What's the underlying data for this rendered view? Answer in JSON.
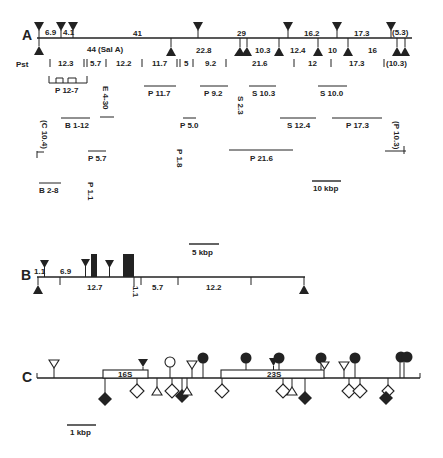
{
  "figure": {
    "panels": [
      "A",
      "B",
      "C"
    ]
  },
  "panel_a": {
    "label": "A",
    "row_label": "Pst",
    "top_fragments": [
      "6.9",
      "4.1",
      "41",
      "29",
      "16.2",
      "17.3",
      "(5.3)"
    ],
    "below_fragments": [
      "44 (Sal A)",
      "22.8",
      "10.3",
      "12.4",
      "10",
      "16"
    ],
    "pst_fragments": [
      "12.3",
      "5.7",
      "12.2",
      "11.7",
      "5",
      "9.2",
      "21.6",
      "12",
      "17.3",
      "(10.3)"
    ],
    "clones": {
      "p12_7": "P 12-7",
      "p11_7": "P 11.7",
      "p9_2": "P 9.2",
      "s10_3": "S 10.3",
      "s10_0": "S 10.0",
      "e4_30": "E 4-30",
      "s2_3": "S 2.3",
      "b1_12": "B 1-12",
      "p5_0": "P 5.0",
      "s12_4": "S 12.4",
      "p17_3": "P 17.3",
      "c10_4": "(C 10.4)",
      "p10_3": "(P 10.3)",
      "p5_7": "P 5.7",
      "p1_8": "P 1.8",
      "p21_6": "P 21.6",
      "b2_8": "B 2-8",
      "p1_1": "P 1.1"
    },
    "scale": "10 kbp"
  },
  "panel_b": {
    "label": "B",
    "fragments_top": [
      "1.1",
      "6.9"
    ],
    "fragments_bottom": [
      "12.7",
      "1.1",
      "5.7",
      "12.2"
    ],
    "scale": "5 kbp"
  },
  "panel_c": {
    "label": "C",
    "genes": [
      "16S",
      "23S"
    ],
    "scale": "1 kbp"
  }
}
